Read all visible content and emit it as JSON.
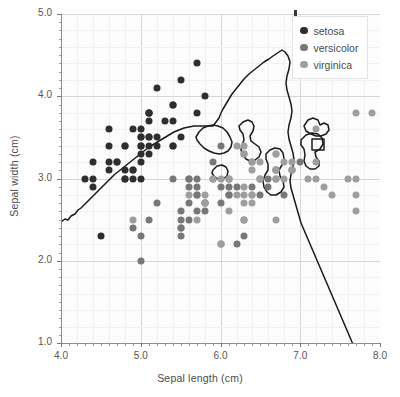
{
  "chart_data": {
    "type": "scatter",
    "title": "",
    "xlabel": "Sepal length (cm)",
    "ylabel": "Sepal width (cm)",
    "xlim": [
      4.0,
      8.0
    ],
    "ylim": [
      1.0,
      5.0
    ],
    "xticks": [
      "4.0",
      "5.0",
      "6.0",
      "7.0",
      "8.0"
    ],
    "yticks": [
      "1.0",
      "2.0",
      "3.0",
      "4.0",
      "5.0"
    ],
    "xtick_values": [
      4.0,
      5.0,
      6.0,
      7.0,
      8.0
    ],
    "ytick_values": [
      1.0,
      2.0,
      3.0,
      4.0,
      5.0
    ],
    "grid": true,
    "minor_grid": true,
    "legend_position": "upper right",
    "annotations": [
      "decision boundary contours overlaid on scatter"
    ],
    "colors": {
      "setosa": "#2e2e2e",
      "versicolor": "#777777",
      "virginica": "#9e9e9e",
      "boundary": "#1a1a1a",
      "grid": "#d6d6d6",
      "minor_grid": "#f0f0f0",
      "background": "#fcfcfc",
      "axis": "#8a8a8a",
      "text": "#4c4c4c"
    },
    "series": [
      {
        "name": "setosa",
        "color": "#2e2e2e",
        "points": [
          [
            5.1,
            3.5
          ],
          [
            4.9,
            3.0
          ],
          [
            4.7,
            3.2
          ],
          [
            4.6,
            3.1
          ],
          [
            5.0,
            3.6
          ],
          [
            5.4,
            3.9
          ],
          [
            4.6,
            3.4
          ],
          [
            5.0,
            3.4
          ],
          [
            4.4,
            2.9
          ],
          [
            4.9,
            3.1
          ],
          [
            5.4,
            3.7
          ],
          [
            4.8,
            3.4
          ],
          [
            4.8,
            3.0
          ],
          [
            4.3,
            3.0
          ],
          [
            5.8,
            4.0
          ],
          [
            5.7,
            4.4
          ],
          [
            5.4,
            3.9
          ],
          [
            5.1,
            3.5
          ],
          [
            5.7,
            3.8
          ],
          [
            5.1,
            3.8
          ],
          [
            5.4,
            3.4
          ],
          [
            5.1,
            3.7
          ],
          [
            4.6,
            3.6
          ],
          [
            5.1,
            3.3
          ],
          [
            4.8,
            3.4
          ],
          [
            5.0,
            3.0
          ],
          [
            5.0,
            3.4
          ],
          [
            5.2,
            3.5
          ],
          [
            5.2,
            3.4
          ],
          [
            4.7,
            3.2
          ],
          [
            4.8,
            3.1
          ],
          [
            5.4,
            3.4
          ],
          [
            5.2,
            4.1
          ],
          [
            5.5,
            4.2
          ],
          [
            4.9,
            3.1
          ],
          [
            5.0,
            3.2
          ],
          [
            5.5,
            3.5
          ],
          [
            4.9,
            3.6
          ],
          [
            4.4,
            3.0
          ],
          [
            5.1,
            3.4
          ],
          [
            5.0,
            3.5
          ],
          [
            4.5,
            2.3
          ],
          [
            4.4,
            3.2
          ],
          [
            5.0,
            3.5
          ],
          [
            5.1,
            3.8
          ],
          [
            4.8,
            3.0
          ],
          [
            5.1,
            3.8
          ],
          [
            4.6,
            3.2
          ],
          [
            5.3,
            3.7
          ],
          [
            5.0,
            3.3
          ]
        ]
      },
      {
        "name": "versicolor",
        "color": "#777777",
        "points": [
          [
            7.0,
            3.2
          ],
          [
            6.4,
            3.2
          ],
          [
            6.9,
            3.1
          ],
          [
            5.5,
            2.3
          ],
          [
            6.5,
            2.8
          ],
          [
            5.7,
            2.8
          ],
          [
            6.3,
            3.3
          ],
          [
            4.9,
            2.4
          ],
          [
            6.6,
            2.9
          ],
          [
            5.2,
            2.7
          ],
          [
            5.0,
            2.0
          ],
          [
            5.9,
            3.0
          ],
          [
            6.0,
            2.2
          ],
          [
            6.1,
            2.9
          ],
          [
            5.6,
            2.9
          ],
          [
            6.7,
            3.1
          ],
          [
            5.6,
            3.0
          ],
          [
            5.8,
            2.7
          ],
          [
            6.2,
            2.2
          ],
          [
            5.6,
            2.5
          ],
          [
            5.9,
            3.2
          ],
          [
            6.1,
            2.8
          ],
          [
            6.3,
            2.5
          ],
          [
            6.1,
            2.8
          ],
          [
            6.4,
            2.9
          ],
          [
            6.6,
            3.0
          ],
          [
            6.8,
            2.8
          ],
          [
            6.7,
            3.0
          ],
          [
            6.0,
            2.9
          ],
          [
            5.7,
            2.6
          ],
          [
            5.5,
            2.4
          ],
          [
            5.5,
            2.4
          ],
          [
            5.8,
            2.7
          ],
          [
            6.0,
            2.7
          ],
          [
            5.4,
            3.0
          ],
          [
            6.0,
            3.4
          ],
          [
            6.7,
            3.1
          ],
          [
            6.3,
            2.3
          ],
          [
            5.6,
            3.0
          ],
          [
            5.5,
            2.5
          ],
          [
            5.5,
            2.6
          ],
          [
            6.1,
            3.0
          ],
          [
            5.8,
            2.6
          ],
          [
            5.0,
            2.3
          ],
          [
            5.6,
            2.7
          ],
          [
            5.7,
            3.0
          ],
          [
            5.7,
            2.9
          ],
          [
            6.2,
            2.9
          ],
          [
            5.1,
            2.5
          ],
          [
            5.7,
            2.8
          ]
        ]
      },
      {
        "name": "virginica",
        "color": "#9e9e9e",
        "points": [
          [
            6.3,
            3.3
          ],
          [
            5.8,
            2.7
          ],
          [
            7.1,
            3.0
          ],
          [
            6.3,
            2.9
          ],
          [
            6.5,
            3.0
          ],
          [
            7.6,
            3.0
          ],
          [
            4.9,
            2.5
          ],
          [
            7.3,
            2.9
          ],
          [
            6.7,
            2.5
          ],
          [
            7.2,
            3.6
          ],
          [
            6.5,
            3.2
          ],
          [
            6.4,
            2.7
          ],
          [
            6.8,
            3.0
          ],
          [
            5.7,
            2.5
          ],
          [
            5.8,
            2.8
          ],
          [
            6.4,
            3.2
          ],
          [
            6.5,
            3.0
          ],
          [
            7.7,
            3.8
          ],
          [
            7.7,
            2.6
          ],
          [
            6.0,
            2.2
          ],
          [
            6.9,
            3.2
          ],
          [
            5.6,
            2.8
          ],
          [
            7.7,
            2.8
          ],
          [
            6.3,
            2.7
          ],
          [
            6.7,
            3.3
          ],
          [
            7.2,
            3.2
          ],
          [
            6.2,
            2.8
          ],
          [
            6.1,
            3.0
          ],
          [
            6.4,
            2.8
          ],
          [
            7.2,
            3.0
          ],
          [
            7.4,
            2.8
          ],
          [
            7.9,
            3.8
          ],
          [
            6.4,
            2.8
          ],
          [
            6.3,
            2.8
          ],
          [
            6.1,
            2.6
          ],
          [
            7.7,
            3.0
          ],
          [
            6.3,
            3.4
          ],
          [
            6.4,
            3.1
          ],
          [
            6.0,
            3.0
          ],
          [
            6.9,
            3.1
          ],
          [
            6.7,
            3.1
          ],
          [
            6.9,
            3.1
          ],
          [
            5.8,
            2.7
          ],
          [
            6.8,
            3.2
          ],
          [
            6.7,
            3.3
          ],
          [
            6.7,
            3.0
          ],
          [
            6.3,
            2.5
          ],
          [
            6.5,
            3.0
          ],
          [
            6.2,
            3.4
          ],
          [
            5.9,
            3.0
          ]
        ]
      }
    ],
    "legend": [
      {
        "label": "setosa",
        "color": "#2e2e2e"
      },
      {
        "label": "versicolor",
        "color": "#777777"
      },
      {
        "label": "virginica",
        "color": "#9e9e9e"
      }
    ]
  }
}
